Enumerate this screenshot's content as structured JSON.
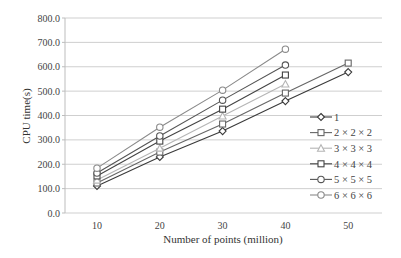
{
  "chart_data": {
    "type": "line",
    "title": "",
    "xlabel": "Number of points (million)",
    "ylabel": "CPU time(s)",
    "ylim": [
      0,
      800
    ],
    "yticks": [
      "0.0",
      "100.0",
      "200.0",
      "300.0",
      "400.0",
      "500.0",
      "600.0",
      "700.0",
      "800.0"
    ],
    "categories": [
      "10",
      "20",
      "30",
      "40",
      "50"
    ],
    "grid": "horizontal",
    "legend_position": "right",
    "series": [
      {
        "name": "1",
        "marker": "diamond",
        "color": "#3a3a3a",
        "values": [
          111,
          230,
          336,
          459,
          578
        ]
      },
      {
        "name": "2 × 2 × 2",
        "marker": "square",
        "color": "#666666",
        "values": [
          123,
          250,
          365,
          492,
          615
        ]
      },
      {
        "name": "3 × 3 × 3",
        "marker": "triangle",
        "color": "#b5b5b5",
        "values": [
          135,
          266,
          398,
          529,
          null
        ]
      },
      {
        "name": "4 × 4 × 4",
        "marker": "square",
        "color": "#444444",
        "values": [
          152,
          295,
          426,
          566,
          null
        ]
      },
      {
        "name": "5 × 5 × 5",
        "marker": "circle",
        "color": "#555555",
        "values": [
          164,
          316,
          463,
          607,
          null
        ]
      },
      {
        "name": "6 × 6 × 6",
        "marker": "circle",
        "color": "#8a8a8a",
        "values": [
          184,
          352,
          504,
          672,
          null
        ]
      }
    ]
  }
}
